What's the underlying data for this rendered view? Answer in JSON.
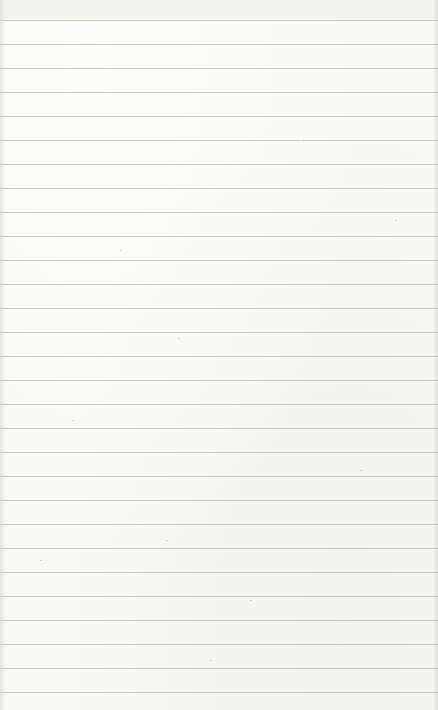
{
  "paper": {
    "type": "lined-paper",
    "background_color": "#f8f8f6",
    "rule_color": "#c9c9c6",
    "first_rule_y": 20,
    "rule_spacing": 24,
    "rule_count": 29
  }
}
